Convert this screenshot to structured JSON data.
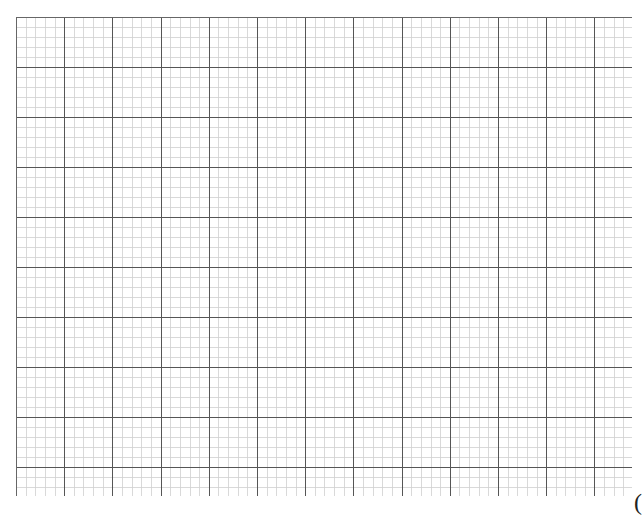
{
  "page": {
    "background": "#ffffff",
    "width": 641,
    "height": 510
  },
  "grid": {
    "origin_x": 16,
    "origin_y": 17,
    "end_x": 632,
    "end_y": 496,
    "major_spacing_x": 48.2,
    "major_spacing_y": 50,
    "minor_per_major": 5,
    "major_color": "#555555",
    "minor_color": "#cfcfcf",
    "border_color": "#666666",
    "major_width": 1.1,
    "minor_width": 0.8,
    "border_sides": [
      "top",
      "left"
    ]
  },
  "corner_glyph": {
    "text": "("
  }
}
